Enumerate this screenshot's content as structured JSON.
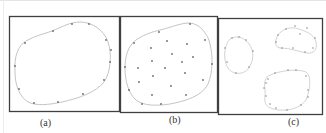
{
  "figure": {
    "panels": [
      {
        "id": "a",
        "caption": "(a)",
        "contours": 1,
        "boundary_points": 13,
        "interior_points": 0
      },
      {
        "id": "b",
        "caption": "(b)",
        "contours": 1,
        "boundary_points": 13,
        "interior_points": 16
      },
      {
        "id": "c",
        "caption": "(c)",
        "contours": 3,
        "boundary_points": [
          8,
          11,
          14
        ],
        "interior_points": 0
      }
    ],
    "colors": {
      "frame": "#404040",
      "curve": "#bdbdbd",
      "point": "#6a6a6a"
    }
  }
}
